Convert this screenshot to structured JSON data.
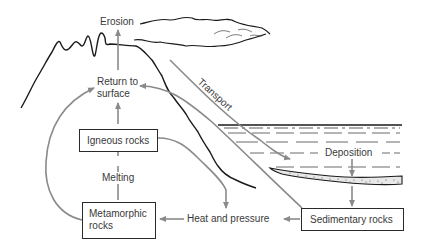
{
  "diagram": {
    "type": "rock cycle",
    "labels": {
      "erosion": "Erosion",
      "return_to_surface_line1": "Return to",
      "return_to_surface_line2": "surface",
      "transport": "Transport",
      "deposition": "Deposition",
      "melting": "Melting",
      "heat_and_pressure": "Heat and pressure"
    },
    "boxes": {
      "igneous": "Igneous rocks",
      "metamorphic_line1": "Metamorphic",
      "metamorphic_line2": "rocks",
      "sedimentary": "Sedimentary rocks"
    },
    "edges": [
      {
        "from": "Return to surface",
        "to": "Erosion"
      },
      {
        "from": "Igneous rocks",
        "to": "Return to surface"
      },
      {
        "from": "Metamorphic rocks",
        "to": "Igneous rocks",
        "label": "Melting"
      },
      {
        "from": "Metamorphic rocks",
        "to": "Return to surface"
      },
      {
        "from": "Igneous rocks",
        "to": "Heat and pressure"
      },
      {
        "from": "Sedimentary rocks",
        "to": "Heat and pressure"
      },
      {
        "from": "Heat and pressure",
        "to": "Metamorphic rocks"
      },
      {
        "from": "Sedimentary rocks",
        "to": "Return to surface"
      },
      {
        "from": "Erosion",
        "to": "Deposition",
        "label": "Transport"
      },
      {
        "from": "Deposition",
        "to": "Sedimentary rocks"
      }
    ],
    "colors": {
      "arrow": "#8a8a8a",
      "outline": "#1a1a1a",
      "text": "#3a3a3a"
    }
  }
}
